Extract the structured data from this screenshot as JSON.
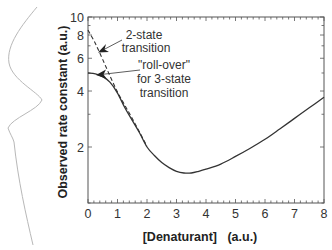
{
  "chart_data": {
    "type": "line",
    "title": "",
    "xlabel": "[Denaturant]   (a.u.)",
    "ylabel": "Observed rate constant  (a.u.)",
    "xlim": [
      0,
      8
    ],
    "ylim": [
      1,
      10
    ],
    "yscale": "log",
    "grid": false,
    "x_ticks": [
      0,
      1,
      2,
      3,
      4,
      5,
      6,
      7,
      8
    ],
    "x_tick_labels": [
      "0",
      "1",
      "2",
      "3",
      "4",
      "5",
      "6",
      "7",
      "8"
    ],
    "y_ticks": [
      2,
      4,
      6,
      8,
      10
    ],
    "y_tick_labels": [
      "2",
      "4",
      "6",
      "8",
      "10"
    ],
    "series": [
      {
        "name": "3-state transition (observed, with roll-over)",
        "style": "solid",
        "x": [
          0,
          0.25,
          0.5,
          0.75,
          1.0,
          1.25,
          1.5,
          1.75,
          2.0,
          2.25,
          2.5,
          2.75,
          3.0,
          3.25,
          3.5,
          3.75,
          4.0,
          4.5,
          5.0,
          5.5,
          6.0,
          6.5,
          7.0,
          7.5,
          8.0
        ],
        "values": [
          5.0,
          4.95,
          4.78,
          4.45,
          3.9,
          3.25,
          2.78,
          2.38,
          2.0,
          1.8,
          1.65,
          1.55,
          1.48,
          1.45,
          1.45,
          1.48,
          1.52,
          1.62,
          1.78,
          1.97,
          2.2,
          2.5,
          2.85,
          3.25,
          3.7
        ]
      },
      {
        "name": "2-state transition",
        "style": "dashed",
        "x": [
          0,
          0.25,
          0.5,
          0.75,
          1.0,
          1.25,
          1.5,
          1.75,
          2.0
        ],
        "values": [
          8.5,
          7.2,
          5.9,
          4.8,
          3.95,
          3.35,
          2.85,
          2.4,
          2.02
        ]
      }
    ],
    "annotations": [
      {
        "lines": [
          "2-state",
          "transition"
        ],
        "arrow_to": {
          "x": 0.35,
          "y": 6.5
        }
      },
      {
        "lines": [
          "\"roll-over\"",
          "for 3-state",
          "transition"
        ],
        "arrow_to": {
          "x": 0.27,
          "y": 4.9
        }
      }
    ]
  },
  "labels": {
    "xlabel": "[Denaturant]   (a.u.)",
    "ylabel": "Observed rate constant  (a.u.)",
    "ann1_line1": "2-state",
    "ann1_line2": "transition",
    "ann2_line1": "\"roll-over\"",
    "ann2_line2": "for 3-state",
    "ann2_line3": "transition"
  },
  "colors": {
    "axis": "#555555",
    "curve": "#333333",
    "decoration": "#b0b0b0"
  }
}
